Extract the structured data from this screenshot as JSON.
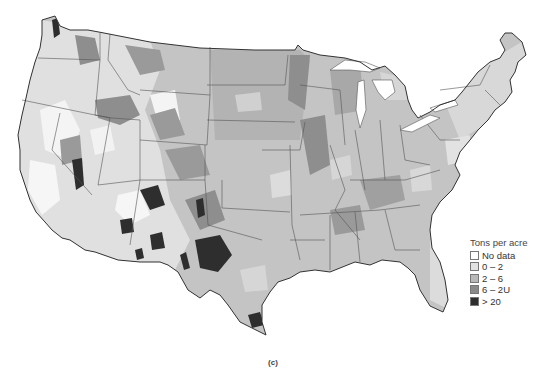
{
  "map": {
    "type": "choropleth",
    "region": "Contiguous United States",
    "caption": "(c)"
  },
  "legend": {
    "title": "Tons per acre",
    "items": [
      {
        "label": "No data",
        "color": "#ffffff"
      },
      {
        "label": "0 – 2",
        "color": "#e2e2e2"
      },
      {
        "label": "2 – 6",
        "color": "#b9b9b9"
      },
      {
        "label": "6 – 2U",
        "color": "#8a8a8a"
      },
      {
        "label": "> 20",
        "color": "#2e2e2e"
      }
    ]
  },
  "colors": {
    "base": "#b9b9b9",
    "light": "#e2e2e2",
    "dark": "#8a8a8a",
    "darkest": "#2e2e2e",
    "border": "#444444"
  }
}
